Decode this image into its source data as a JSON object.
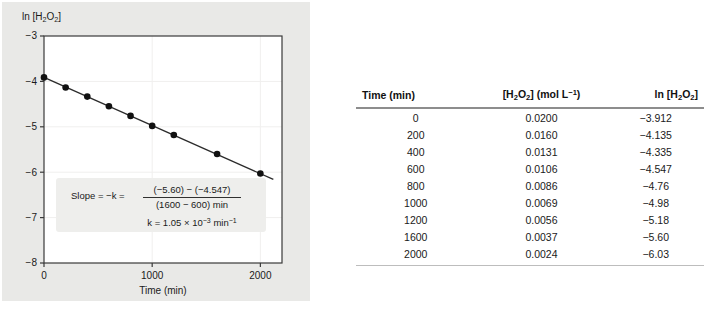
{
  "chart_data": {
    "type": "scatter",
    "title": "",
    "xlabel": "Time (min)",
    "ylabel": "ln [H2O2]",
    "ylabel_html": "ln [H<sub>2</sub>O<sub>2</sub>]",
    "x": [
      0,
      200,
      400,
      600,
      800,
      1000,
      1200,
      1600,
      2000
    ],
    "y": [
      -3.912,
      -4.135,
      -4.335,
      -4.547,
      -4.76,
      -4.98,
      -5.18,
      -5.6,
      -6.03
    ],
    "series": [
      {
        "name": "ln [H2O2] vs time",
        "values": [
          -3.912,
          -4.135,
          -4.335,
          -4.547,
          -4.76,
          -4.98,
          -5.18,
          -5.6,
          -6.03
        ]
      }
    ],
    "xlim": [
      0,
      2200
    ],
    "ylim": [
      -8,
      -3
    ],
    "xticks": [
      0,
      1000,
      2000
    ],
    "xtick_labels": [
      "0",
      "1000",
      "2000"
    ],
    "yticks": [
      -3,
      -4,
      -5,
      -6,
      -7,
      -8
    ],
    "ytick_labels": [
      "−3",
      "−4",
      "−5",
      "−6",
      "−7",
      "−8"
    ],
    "grid": true,
    "legend": "none",
    "fit_line": {
      "from": [
        0,
        -3.912
      ],
      "to": [
        2120,
        -6.16
      ],
      "slope": -0.00105
    },
    "annotation": {
      "line1_label": "Slope = −k =",
      "numerator": "(−5.60) − (−4.547)",
      "denominator": "(1600 − 600) min",
      "line2": "k = 1.05 × 10⁻³ min⁻¹",
      "line2_parts": {
        "k": "k",
        "equals": "=",
        "value": "1.05",
        "times": "×",
        "base": "10",
        "exponent": "−3",
        "unit": "min",
        "unit_exponent": "−1"
      }
    }
  },
  "table": {
    "headers": [
      {
        "text": "Time (min)",
        "html": "Time (min)"
      },
      {
        "text": "[H2O2] (mol L-1)",
        "html": "[H<sub>2</sub>O<sub>2</sub>] (mol L<sup>−1</sup>)"
      },
      {
        "text": "ln [H2O2]",
        "html": "ln [H<sub>2</sub>O<sub>2</sub>]"
      }
    ],
    "rows": [
      {
        "time": "0",
        "conc": "0.0200",
        "ln": "−3.912"
      },
      {
        "time": "200",
        "conc": "0.0160",
        "ln": "−4.135"
      },
      {
        "time": "400",
        "conc": "0.0131",
        "ln": "−4.335"
      },
      {
        "time": "600",
        "conc": "0.0106",
        "ln": "−4.547"
      },
      {
        "time": "800",
        "conc": "0.0086",
        "ln": "−4.76"
      },
      {
        "time": "1000",
        "conc": "0.0069",
        "ln": "−4.98"
      },
      {
        "time": "1200",
        "conc": "0.0056",
        "ln": "−5.18"
      },
      {
        "time": "1600",
        "conc": "0.0037",
        "ln": "−5.60"
      },
      {
        "time": "2000",
        "conc": "0.0024",
        "ln": "−6.03"
      }
    ]
  },
  "colors": {
    "panel_background": "#e9e9e7",
    "plot_background": "#ffffff",
    "axis": "#3a3a3a",
    "marker": "#111111",
    "line": "#2b2b2b",
    "grid": "#f0efee",
    "table_rule": "#8d8d8d",
    "table_rule_bottom": "#bdbdbd",
    "annotation_background": "#eeeeec",
    "text": "#1a1a1a"
  }
}
